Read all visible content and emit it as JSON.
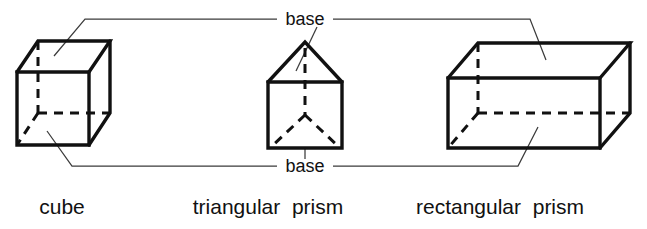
{
  "figure": {
    "background_color": "#ffffff",
    "line_color": "#111111",
    "leader_color": "#3b3b3b",
    "width": 647,
    "height": 229
  },
  "annotations": {
    "top_base_label": "base",
    "bottom_base_label": "base"
  },
  "captions": {
    "cube": "cube",
    "triangular_prism": "triangular  prism",
    "rectangular_prism": "rectangular  prism"
  },
  "shapes": [
    {
      "id": "cube",
      "name": "cube",
      "caption": "cube",
      "faces": 6,
      "visible_faces": [
        "front",
        "top",
        "right"
      ],
      "hidden_edges": "dashed back vertical and two dashed back base edges",
      "front_face": {
        "left": 17,
        "top": 72,
        "right": 89,
        "bottom": 145
      },
      "depth_offset": {
        "dx": 21,
        "dy": -32
      }
    },
    {
      "id": "triangular-prism",
      "name": "triangular prism",
      "caption": "triangular  prism",
      "faces": 5,
      "visible_faces": [
        "front-rectangle",
        "two-slanted-roof"
      ],
      "hidden_edges": "dashed vertical apex line and dashed Y back edges",
      "apex": {
        "x": 305,
        "y": 42
      },
      "body": {
        "left": 268,
        "top": 82,
        "right": 342,
        "bottom": 148
      }
    },
    {
      "id": "rectangular-prism",
      "name": "rectangular prism",
      "caption": "rectangular  prism",
      "faces": 6,
      "visible_faces": [
        "front",
        "top",
        "right"
      ],
      "hidden_edges": "dashed back vertical and two dashed back base edges",
      "front_face": {
        "left": 448,
        "top": 78,
        "right": 600,
        "bottom": 148
      },
      "depth_offset": {
        "dx": 30,
        "dy": -35
      }
    }
  ]
}
